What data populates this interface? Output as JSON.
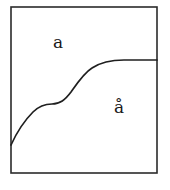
{
  "figure": {
    "background_color": "#ffffff",
    "frame": {
      "stroke_color": "#2b2b2b",
      "stroke_width": 1.6,
      "x": 11,
      "y": 7,
      "width": 146,
      "height": 166
    },
    "divider": {
      "stroke_color": "#1f1f1f",
      "stroke_width": 1.7,
      "shape": "s-curve",
      "description": "monotonic rising S-shaped curve from left border to right border",
      "start_point": [
        11,
        145
      ],
      "end_point": [
        157,
        60
      ],
      "path": "M 11 145 C 16 134, 24 121, 33 112 C 39 106, 45 104, 52 104 C 60 104, 65 100, 71 92 C 78 82, 84 73, 92 68 C 101 62, 112 60, 124 60 L 157 60",
      "points": [
        [
          11,
          145
        ],
        [
          20,
          129
        ],
        [
          28,
          118
        ],
        [
          36,
          110
        ],
        [
          44,
          105
        ],
        [
          52,
          104
        ],
        [
          60,
          100
        ],
        [
          68,
          93
        ],
        [
          76,
          84
        ],
        [
          84,
          74
        ],
        [
          94,
          66
        ],
        [
          106,
          61
        ],
        [
          124,
          60
        ],
        [
          157,
          60
        ]
      ]
    },
    "labels": [
      {
        "name": "upper-region-label",
        "text": "a",
        "x": 58,
        "y": 43,
        "font_size": 17,
        "color": "#1a1a1a",
        "region": "upper-left"
      },
      {
        "name": "lower-region-label",
        "text": "å",
        "x": 119,
        "y": 108,
        "font_size": 17,
        "color": "#1a1a1a",
        "region": "lower-right"
      }
    ]
  }
}
